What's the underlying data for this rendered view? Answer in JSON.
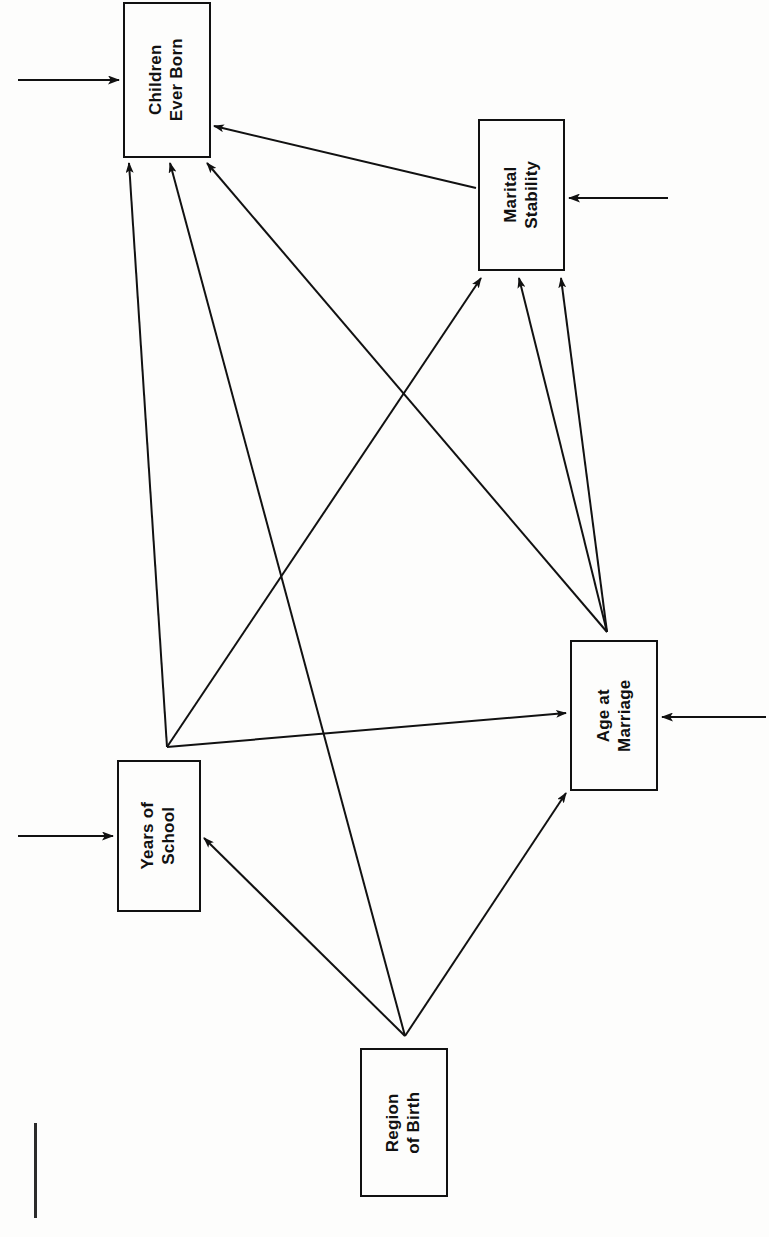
{
  "figure": {
    "type": "path-diagram",
    "orientation": "rotated-90-counterclockwise",
    "background_color": "#fdfdfc",
    "line_color": "#111111"
  },
  "nodes": [
    {
      "id": "children-ever-born",
      "line1": "Children",
      "line2": "Ever Born",
      "x": 123,
      "y": 2,
      "w": 88,
      "h": 156
    },
    {
      "id": "marital-stability",
      "line1": "Marital",
      "line2": "Stability",
      "x": 478,
      "y": 119,
      "w": 87,
      "h": 152
    },
    {
      "id": "age-at-marriage",
      "line1": "Age at",
      "line2": "Marriage",
      "x": 570,
      "y": 640,
      "w": 88,
      "h": 151
    },
    {
      "id": "years-of-school",
      "line1": "Years of",
      "line2": "School",
      "x": 117,
      "y": 760,
      "w": 84,
      "h": 152
    },
    {
      "id": "region-of-birth",
      "line1": "Region",
      "line2": "of Birth",
      "x": 360,
      "y": 1048,
      "w": 88,
      "h": 149
    }
  ],
  "edges": [
    {
      "id": "marital-stability-to-children-ever-born",
      "from": "marital-stability",
      "to": "children-ever-born",
      "x1": 476,
      "y1": 188,
      "x2": 214,
      "y2": 126
    },
    {
      "id": "age-at-marriage-to-children-ever-born",
      "from": "age-at-marriage",
      "to": "children-ever-born",
      "x1": 607,
      "y1": 632,
      "x2": 207,
      "y2": 163
    },
    {
      "id": "years-of-school-to-children-ever-born",
      "from": "years-of-school",
      "to": "children-ever-born",
      "x1": 167,
      "y1": 747,
      "x2": 129,
      "y2": 163
    },
    {
      "id": "region-of-birth-to-children-ever-born",
      "from": "region-of-birth",
      "to": "children-ever-born",
      "x1": 405,
      "y1": 1036,
      "x2": 170,
      "y2": 163
    },
    {
      "id": "years-of-school-to-marital-stability",
      "from": "years-of-school",
      "to": "marital-stability",
      "x1": 167,
      "y1": 747,
      "x2": 481,
      "y2": 278
    },
    {
      "id": "age-at-marriage-to-marital-stability-a",
      "from": "age-at-marriage",
      "to": "marital-stability",
      "x1": 607,
      "y1": 632,
      "x2": 519,
      "y2": 278
    },
    {
      "id": "age-at-marriage-to-marital-stability-b",
      "from": "age-at-marriage",
      "to": "marital-stability",
      "x1": 607,
      "y1": 632,
      "x2": 561,
      "y2": 278
    },
    {
      "id": "years-of-school-to-age-at-marriage",
      "from": "years-of-school",
      "to": "age-at-marriage",
      "x1": 167,
      "y1": 747,
      "x2": 566,
      "y2": 713
    },
    {
      "id": "region-of-birth-to-age-at-marriage",
      "from": "region-of-birth",
      "to": "age-at-marriage",
      "x1": 405,
      "y1": 1036,
      "x2": 566,
      "y2": 793
    },
    {
      "id": "region-of-birth-to-years-of-school",
      "from": "region-of-birth",
      "to": "years-of-school",
      "x1": 405,
      "y1": 1036,
      "x2": 204,
      "y2": 838
    }
  ],
  "disturbances": [
    {
      "id": "disturbance-children-ever-born",
      "target": "children-ever-born",
      "x1": 18,
      "y1": 80,
      "x2": 119,
      "y2": 80
    },
    {
      "id": "disturbance-marital-stability",
      "target": "marital-stability",
      "x1": 668,
      "y1": 198,
      "x2": 569,
      "y2": 198
    },
    {
      "id": "disturbance-age-at-marriage",
      "target": "age-at-marriage",
      "x1": 766,
      "y1": 717,
      "x2": 662,
      "y2": 717
    },
    {
      "id": "disturbance-years-of-school",
      "target": "years-of-school",
      "x1": 18,
      "y1": 836,
      "x2": 113,
      "y2": 836
    }
  ],
  "artifacts": [
    {
      "id": "page-edge-mark",
      "x": 34,
      "y": 1123,
      "w": 3,
      "h": 95
    }
  ]
}
